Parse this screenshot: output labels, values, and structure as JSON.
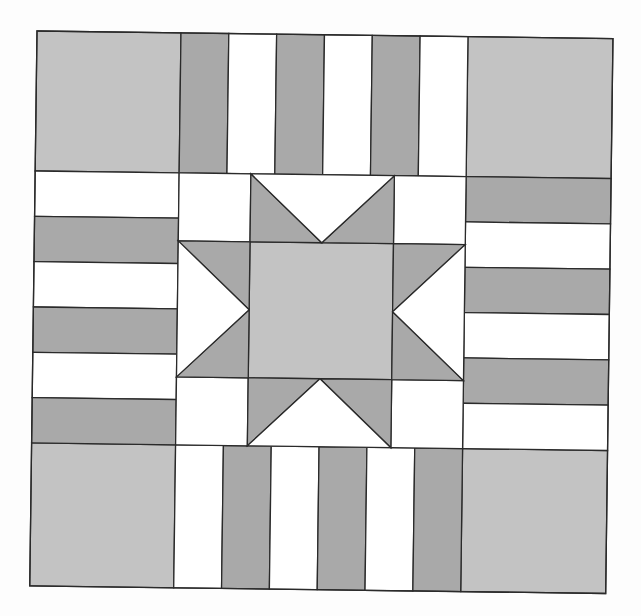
{
  "diagram": {
    "type": "quilt-block",
    "pattern": "sawtooth-star-with-rail-fence-border",
    "colors": {
      "light_gray": "#c3c3c3",
      "dark_gray": "#a9a9a9",
      "white": "#ffffff",
      "outline": "#2a2a2a",
      "background": "#fdfdfd"
    },
    "frame": {
      "origin": [
        37,
        31
      ],
      "width": 576,
      "height": 555,
      "rotation_deg": 0.75
    },
    "grid": {
      "col_edges": [
        0,
        144,
        431,
        576
      ],
      "row_edges": [
        0,
        140,
        412,
        555
      ]
    },
    "corner_squares": [
      {
        "id": "top-left",
        "fill": "light_gray"
      },
      {
        "id": "top-right",
        "fill": "light_gray"
      },
      {
        "id": "bottom-left",
        "fill": "light_gray"
      },
      {
        "id": "bottom-right",
        "fill": "light_gray"
      }
    ],
    "rail_strips": {
      "top": {
        "orientation": "vertical",
        "stripes": [
          "dark_gray",
          "white",
          "dark_gray",
          "white",
          "dark_gray",
          "white"
        ]
      },
      "bottom": {
        "orientation": "vertical",
        "stripes": [
          "white",
          "dark_gray",
          "white",
          "dark_gray",
          "white",
          "dark_gray"
        ]
      },
      "left": {
        "orientation": "horizontal",
        "stripes": [
          "white",
          "dark_gray",
          "white",
          "dark_gray",
          "white",
          "dark_gray"
        ]
      },
      "right": {
        "orientation": "horizontal",
        "stripes": [
          "dark_gray",
          "white",
          "dark_gray",
          "white",
          "dark_gray",
          "white"
        ]
      }
    },
    "center_star": {
      "center_square_fill": "light_gray",
      "star_point_fill": "dark_gray",
      "background_fill": "white",
      "corner_units": 4,
      "flying_geese_units": 4,
      "points": 8
    }
  }
}
